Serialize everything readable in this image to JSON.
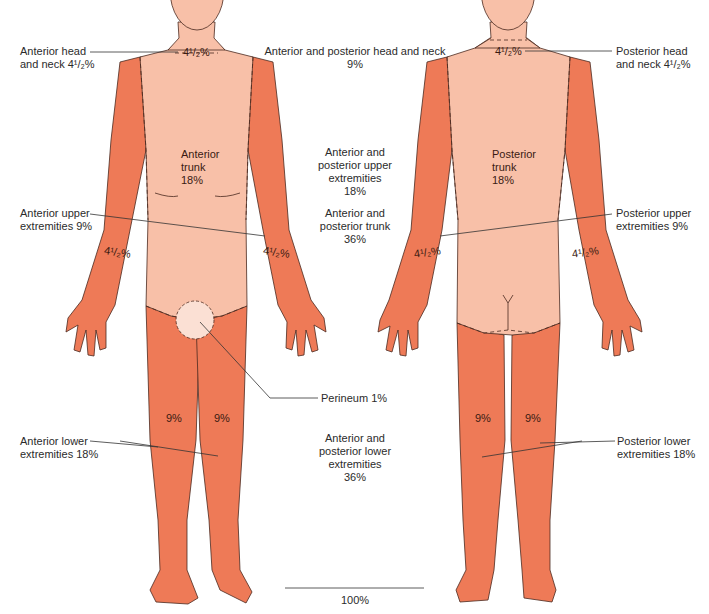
{
  "colors": {
    "light_region": "#f8c0a8",
    "dark_region": "#ee7a57",
    "outline": "#4a2a20",
    "leader_line": "#333333",
    "text": "#2b2b2b"
  },
  "anterior": {
    "head_value": "4¹/₂%",
    "head_label_line1": "Anterior head",
    "head_label_line2": "and neck 4¹/₂%",
    "trunk_line1": "Anterior",
    "trunk_line2": "trunk",
    "trunk_line3": "18%",
    "upper_label_line1": "Anterior upper",
    "upper_label_line2": "extremities 9%",
    "left_arm_value": "4¹/₂%",
    "right_arm_value": "4¹/₂%",
    "left_leg_value": "9%",
    "right_leg_value": "9%",
    "lower_label_line1": "Anterior lower",
    "lower_label_line2": "extremities 18%",
    "perineum_label": "Perineum 1%"
  },
  "posterior": {
    "head_value": "4¹/₂%",
    "head_label_line1": "Posterior head",
    "head_label_line2": "and neck 4¹/₂%",
    "trunk_line1": "Posterior",
    "trunk_line2": "trunk",
    "trunk_line3": "18%",
    "upper_label_line1": "Posterior upper",
    "upper_label_line2": "extremities 9%",
    "left_arm_value": "4¹/₂%",
    "right_arm_value": "4¹/₂%",
    "left_leg_value": "9%",
    "right_leg_value": "9%",
    "lower_label_line1": "Posterior lower",
    "lower_label_line2": "extremities 18%"
  },
  "totals": {
    "head_neck_line1": "Anterior and posterior head and neck",
    "head_neck_line2": "9%",
    "upper_ext_line1": "Anterior and",
    "upper_ext_line2": "posterior upper",
    "upper_ext_line3": "extremities",
    "upper_ext_line4": "18%",
    "trunk_line1": "Anterior and",
    "trunk_line2": "posterior trunk",
    "trunk_line3": "36%",
    "lower_ext_line1": "Anterior and",
    "lower_ext_line2": "posterior lower",
    "lower_ext_line3": "extremities",
    "lower_ext_line4": "36%",
    "grand_total": "100%"
  }
}
